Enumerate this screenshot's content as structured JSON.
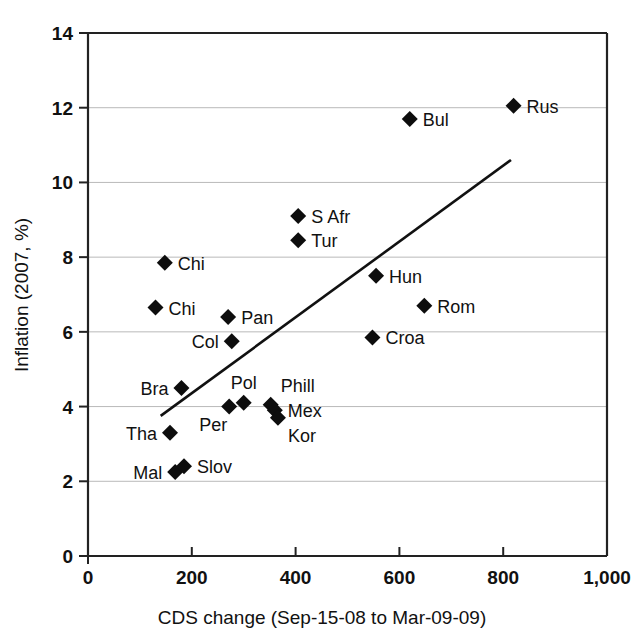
{
  "chart_data": {
    "type": "scatter",
    "title": "",
    "xlabel": "CDS change (Sep-15-08 to Mar-09-09)",
    "ylabel": "Inflation (2007, %)",
    "xlim": [
      0,
      1000
    ],
    "ylim": [
      0,
      14
    ],
    "xticks": [
      0,
      200,
      400,
      600,
      800,
      1000
    ],
    "xtick_labels": [
      "0",
      "200",
      "400",
      "600",
      "800",
      "1,000"
    ],
    "yticks": [
      0,
      2,
      4,
      6,
      8,
      10,
      12,
      14
    ],
    "ytick_labels": [
      "0",
      "2",
      "4",
      "6",
      "8",
      "10",
      "12",
      "14"
    ],
    "grid": "horizontal",
    "legend": "none",
    "marker": "diamond",
    "marker_color": "#0d0d0d",
    "points": [
      {
        "label": "Chi",
        "x": 148,
        "y": 7.85,
        "label_pos": "right"
      },
      {
        "label": "Chi",
        "x": 130,
        "y": 6.65,
        "label_pos": "right"
      },
      {
        "label": "Pan",
        "x": 270,
        "y": 6.4,
        "label_pos": "right"
      },
      {
        "label": "Col",
        "x": 277,
        "y": 5.75,
        "label_pos": "left"
      },
      {
        "label": "Bra",
        "x": 180,
        "y": 4.5,
        "label_pos": "left"
      },
      {
        "label": "Tha",
        "x": 158,
        "y": 3.3,
        "label_pos": "left"
      },
      {
        "label": "Mal",
        "x": 168,
        "y": 2.25,
        "label_pos": "left"
      },
      {
        "label": "Slov",
        "x": 185,
        "y": 2.4,
        "label_pos": "right"
      },
      {
        "label": "Per",
        "x": 272,
        "y": 4.0,
        "label_pos": "below-left"
      },
      {
        "label": "Pol",
        "x": 300,
        "y": 4.1,
        "label_pos": "above"
      },
      {
        "label": "Phill",
        "x": 352,
        "y": 4.05,
        "label_pos": "above-right"
      },
      {
        "label": "Mex",
        "x": 360,
        "y": 3.9,
        "label_pos": "right"
      },
      {
        "label": "Kor",
        "x": 366,
        "y": 3.7,
        "label_pos": "below-right"
      },
      {
        "label": "S Afr",
        "x": 405,
        "y": 9.1,
        "label_pos": "right"
      },
      {
        "label": "Tur",
        "x": 405,
        "y": 8.45,
        "label_pos": "right"
      },
      {
        "label": "Bul",
        "x": 620,
        "y": 11.7,
        "label_pos": "right"
      },
      {
        "label": "Rus",
        "x": 820,
        "y": 12.05,
        "label_pos": "right"
      },
      {
        "label": "Hun",
        "x": 555,
        "y": 7.5,
        "label_pos": "right"
      },
      {
        "label": "Rom",
        "x": 648,
        "y": 6.7,
        "label_pos": "right"
      },
      {
        "label": "Croa",
        "x": 548,
        "y": 5.85,
        "label_pos": "right"
      }
    ],
    "trend_line": {
      "x_start": 140,
      "y_start": 3.75,
      "x_end": 815,
      "y_end": 10.6
    }
  }
}
